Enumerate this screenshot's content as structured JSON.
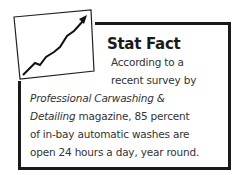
{
  "sidebar": {
    "title": "Stat Fact",
    "icon": "rising-line-chart-icon",
    "lines": [
      {
        "text": "According to a"
      },
      {
        "text": "recent survey by"
      },
      {
        "italic": "Professional Carwashing &"
      },
      {
        "italic": "Detailing",
        "text": " magazine, 85 percent"
      },
      {
        "text": "of in-bay automatic washes are"
      },
      {
        "text": "open 24 hours a day, year round."
      }
    ]
  },
  "colors": {
    "border": "#1a1a1a",
    "text": "#333333"
  }
}
